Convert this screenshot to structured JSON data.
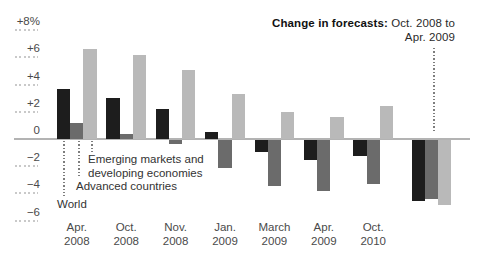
{
  "title": {
    "bold": "Change in forecasts:",
    "rest": " Oct. 2008 to",
    "line2": "Apr. 2009"
  },
  "colors": {
    "bar_world": "#1d1d1d",
    "bar_advanced": "#6b6b6b",
    "bar_emerging": "#b9b9b9",
    "zero_line": "#b3b3b3",
    "tick_line": "#c9c9c9",
    "axis_text": "#4a4a4a"
  },
  "chart_data": {
    "type": "bar",
    "title": "Change in forecasts: Oct. 2008 to Apr. 2009",
    "unit": "%",
    "categories": [
      "Apr.\n2008",
      "Oct.\n2008",
      "Nov.\n2008",
      "Jan.\n2009",
      "March\n2009",
      "Apr.\n2009",
      "Oct.\n2010",
      ""
    ],
    "series": [
      {
        "name": "World",
        "key": "world",
        "color": "#1d1d1d",
        "values": [
          3.7,
          3.0,
          2.2,
          0.5,
          -0.9,
          -1.5,
          -1.2,
          -4.5
        ]
      },
      {
        "name": "Advanced countries",
        "key": "advanced",
        "color": "#6b6b6b",
        "values": [
          1.2,
          0.4,
          -0.3,
          -2.1,
          -3.4,
          -3.8,
          -3.3,
          -4.4
        ]
      },
      {
        "name": "Emerging markets and developing economies",
        "key": "emerging",
        "color": "#b9b9b9",
        "values": [
          6.6,
          6.2,
          5.1,
          3.3,
          2.0,
          1.6,
          2.4,
          -4.8
        ]
      }
    ],
    "y_axis": {
      "ticks": [
        {
          "label": "+8%",
          "value": 8
        },
        {
          "label": "+6",
          "value": 6
        },
        {
          "label": "+4",
          "value": 4
        },
        {
          "label": "+2",
          "value": 2
        },
        {
          "label": "0",
          "value": 0
        },
        {
          "label": "−2",
          "value": -2
        },
        {
          "label": "−4",
          "value": -4
        },
        {
          "label": "−6",
          "value": -6
        }
      ],
      "ylim": [
        -6.5,
        8.5
      ]
    },
    "grid": false,
    "legend_position": "inline-annotations",
    "annotations": {
      "world": "World",
      "advanced": "Advanced countries",
      "emerging": "Emerging markets and\ndeveloping economies"
    }
  }
}
